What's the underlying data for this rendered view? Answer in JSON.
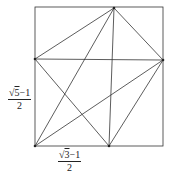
{
  "diagram": {
    "square": {
      "x": 35,
      "y": 7,
      "width": 128,
      "height": 139
    },
    "points": {
      "A": [
        35,
        146
      ],
      "B": [
        109,
        146
      ],
      "C": [
        163,
        60
      ],
      "D": [
        114,
        8
      ],
      "E": [
        35,
        59
      ]
    },
    "segments": [
      [
        "E",
        "C"
      ],
      [
        "E",
        "D"
      ],
      [
        "D",
        "C"
      ],
      [
        "A",
        "D"
      ],
      [
        "A",
        "C"
      ],
      [
        "E",
        "B"
      ],
      [
        "D",
        "B"
      ],
      [
        "B",
        "C"
      ]
    ],
    "stroke_color": "#333333",
    "labels": {
      "left": {
        "radicand": "5",
        "numerator_rest": "−1",
        "denominator": "2",
        "prefix": "√"
      },
      "bottom": {
        "radicand": "3",
        "numerator_rest": "−1",
        "denominator": "2",
        "prefix": "√"
      }
    }
  }
}
